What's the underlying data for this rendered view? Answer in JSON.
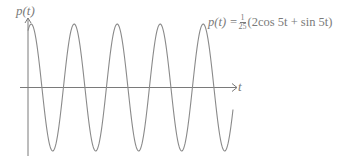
{
  "chart_data": {
    "type": "line",
    "title": "",
    "xlabel": "t",
    "ylabel": "p(t)",
    "annotation": {
      "lhs": "p(t) =",
      "frac_num": "1",
      "frac_den": "25",
      "rhs": "(2cos 5t + sin 5t)"
    },
    "function": "p(t) = (1/25)(2cos(5t) + sin(5t))",
    "amplitude": 0.0894,
    "angular_frequency": 5,
    "phase_shift_rad": 0.4636,
    "x_range_periods": 4.77,
    "cycles_shown": 5,
    "grid": false,
    "legend": "none",
    "ticks": "none",
    "colors": {
      "curve": "#8a8a8a",
      "axes": "#7a7a7a",
      "text": "#7a7a7a"
    }
  },
  "layout": {
    "origin_x": 28,
    "axis_y": 87.5,
    "amp_px": 63.5,
    "period_px": 43,
    "x_end": 233,
    "x_axis_end": 237,
    "y_axis_top": 18,
    "y_axis_bottom": 156
  }
}
